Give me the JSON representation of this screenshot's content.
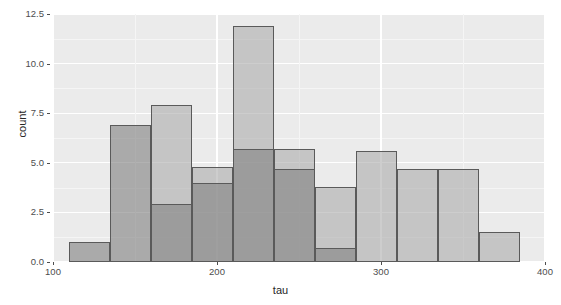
{
  "chart": {
    "xlabel": "tau",
    "ylabel": "count",
    "xticks": [
      "100",
      "200",
      "300",
      "400"
    ],
    "yticks": [
      "0.0",
      "2.5",
      "5.0",
      "7.5",
      "10.0",
      "12.5"
    ],
    "panel_bg": "#ebebeb",
    "grid_color": "#ffffff",
    "series_a_color": "#828282",
    "series_b_color": "#afafaf"
  },
  "chart_data": {
    "type": "bar",
    "subtype": "histogram-overlay",
    "title": "",
    "xlabel": "tau",
    "ylabel": "count",
    "xlim": [
      100,
      400
    ],
    "ylim": [
      0,
      12.5
    ],
    "xticks": [
      100,
      200,
      300,
      400
    ],
    "yticks": [
      0.0,
      2.5,
      5.0,
      7.5,
      10.0,
      12.5
    ],
    "grid": true,
    "legend": "none",
    "bin_width": 25,
    "bin_edges": [
      110,
      135,
      160,
      185,
      210,
      235,
      260,
      285,
      310,
      335,
      360,
      385
    ],
    "series": [
      {
        "name": "series-a",
        "color": "#828282",
        "opacity": 0.62,
        "bin_starts": [
          110,
          135,
          160,
          185,
          210,
          235,
          260,
          285
        ],
        "values": [
          1.0,
          6.9,
          2.9,
          4.0,
          5.7,
          4.7,
          0.7,
          0.0
        ]
      },
      {
        "name": "series-b",
        "color": "#afafaf",
        "opacity": 0.62,
        "bin_starts": [
          160,
          185,
          210,
          235,
          260,
          285,
          310,
          335,
          360
        ],
        "values": [
          7.9,
          4.8,
          11.9,
          5.7,
          3.8,
          5.6,
          4.7,
          4.7,
          1.5
        ]
      }
    ]
  }
}
